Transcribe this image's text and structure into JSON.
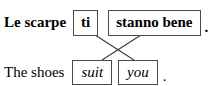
{
  "figure": {
    "type": "interlinear-gloss-alignment-diagram",
    "rows": [
      {
        "id": "italian",
        "language_style": "bold",
        "lead_text": "Le scarpe",
        "chunks": [
          {
            "id": "ti",
            "text": "ti"
          },
          {
            "id": "stanno-bene",
            "text": "stanno bene"
          }
        ],
        "terminal_punctuation": "."
      },
      {
        "id": "english",
        "language_style": "italic",
        "lead_text": "The shoes",
        "chunks": [
          {
            "id": "suit",
            "text": "suit"
          },
          {
            "id": "you",
            "text": "you"
          }
        ],
        "terminal_punctuation": "."
      }
    ],
    "connectors": [
      {
        "id": "ti-to-you",
        "from": "ti",
        "to": "you",
        "x1": 95,
        "y1": 35,
        "x2": 134,
        "y2": 60
      },
      {
        "id": "stanno-bene-to-suit",
        "from": "stanno-bene",
        "to": "suit",
        "x1": 141,
        "y1": 35,
        "x2": 102,
        "y2": 60
      }
    ],
    "colors": {
      "background": "#ffffff",
      "text": "#000000",
      "box_border": "#4a4a4a",
      "connector_line": "#3a3a3a"
    }
  }
}
